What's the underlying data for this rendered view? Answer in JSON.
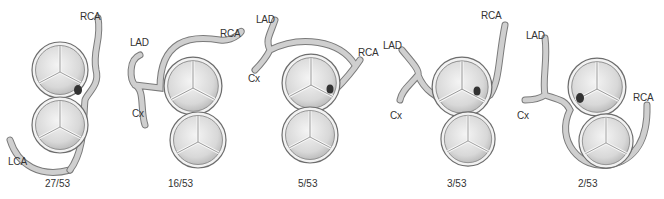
{
  "figure": {
    "panels": [
      {
        "id": "p1",
        "caption": "27/53",
        "labels": {
          "rca": "RCA",
          "lca": "LCA"
        }
      },
      {
        "id": "p2",
        "caption": "16/53",
        "labels": {
          "lad": "LAD",
          "rca": "RCA",
          "cx": "Cx"
        }
      },
      {
        "id": "p3",
        "caption": "5/53",
        "labels": {
          "lad": "LAD",
          "rca": "RCA",
          "cx": "Cx"
        }
      },
      {
        "id": "p4",
        "caption": "3/53",
        "labels": {
          "lad": "LAD",
          "rca": "RCA",
          "cx": "Cx"
        }
      },
      {
        "id": "p5",
        "caption": "2/53",
        "labels": {
          "lad": "LAD",
          "rca": "RCA",
          "cx": "Cx"
        }
      }
    ]
  },
  "colors": {
    "vessel": "#c9c9c9",
    "vessel_edge": "#7a7a7a",
    "valve_fill": "#e6e6e6",
    "valve_edge": "#6d6d6d",
    "text": "#333333"
  }
}
